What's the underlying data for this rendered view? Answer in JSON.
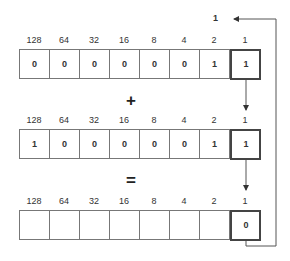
{
  "carry": "1",
  "place_values": [
    "128",
    "64",
    "32",
    "16",
    "8",
    "4",
    "2",
    "1"
  ],
  "rows": [
    {
      "bits": [
        "0",
        "0",
        "0",
        "0",
        "0",
        "0",
        "1",
        "1"
      ]
    },
    {
      "bits": [
        "1",
        "0",
        "0",
        "0",
        "0",
        "0",
        "1",
        "1"
      ]
    },
    {
      "bits": [
        "",
        "",
        "",
        "",
        "",
        "",
        "",
        "0"
      ]
    }
  ],
  "operators": {
    "plus": "+",
    "equals": "="
  }
}
